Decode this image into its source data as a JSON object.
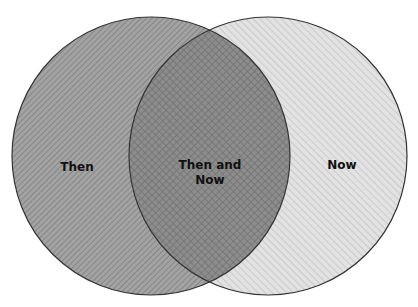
{
  "diagram": {
    "type": "venn",
    "sets": [
      {
        "id": "then",
        "label": "Then",
        "fill": "#9a9a9a",
        "hatch": "diagonal-dark"
      },
      {
        "id": "now",
        "label": "Now",
        "fill": "#d9d9d9",
        "hatch": "diagonal-light"
      }
    ],
    "intersection": {
      "label_line1": "Then and",
      "label_line2": "Now",
      "hatch": "crosshatch"
    },
    "colors": {
      "outline": "#333333",
      "text": "#111111"
    }
  }
}
